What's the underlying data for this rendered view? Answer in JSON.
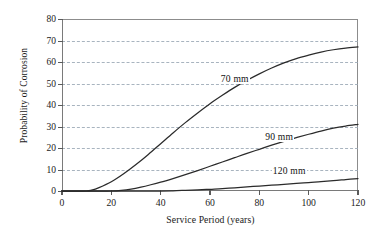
{
  "chart_data": {
    "type": "line",
    "title": "",
    "xlabel": "Service Period (years)",
    "ylabel": "Probability of Corrosion",
    "xlim": [
      0,
      120
    ],
    "ylim": [
      0,
      80
    ],
    "xticks": [
      0,
      20,
      40,
      60,
      80,
      100,
      120
    ],
    "yticks": [
      0,
      10,
      20,
      30,
      40,
      50,
      60,
      70,
      80
    ],
    "xtick_labels": [
      "0",
      "20",
      "40",
      "60",
      "80",
      "100",
      "120"
    ],
    "ytick_labels": [
      "0",
      "10",
      "20",
      "30",
      "40",
      "50",
      "60",
      "70",
      "80"
    ],
    "grid": "horizontal-dashed",
    "legend": "inline-labels",
    "series": [
      {
        "name": "70 mm",
        "label": "70 mm",
        "label_x": 64,
        "label_y": 52,
        "color": "#2b2b2b",
        "x": [
          0,
          5,
          10,
          12,
          15,
          20,
          25,
          30,
          35,
          40,
          45,
          50,
          55,
          60,
          65,
          70,
          75,
          80,
          85,
          90,
          95,
          100,
          105,
          110,
          115,
          120
        ],
        "y": [
          0,
          0,
          0,
          0.4,
          1.6,
          4.3,
          8.0,
          12.3,
          17.0,
          22.0,
          27.0,
          31.8,
          36.3,
          40.6,
          44.5,
          48.2,
          51.5,
          54.5,
          57.2,
          59.6,
          61.6,
          63.2,
          64.6,
          65.7,
          66.5,
          67.0
        ]
      },
      {
        "name": "90 mm",
        "label": "90 mm",
        "label_x": 82,
        "label_y": 25,
        "color": "#2b2b2b",
        "x": [
          0,
          5,
          10,
          15,
          20,
          24,
          28,
          32,
          36,
          40,
          45,
          50,
          55,
          60,
          65,
          70,
          75,
          80,
          85,
          90,
          95,
          100,
          105,
          110,
          115,
          120
        ],
        "y": [
          0,
          0,
          0,
          0,
          0,
          0.3,
          0.9,
          1.8,
          2.9,
          4.1,
          5.8,
          7.6,
          9.5,
          11.5,
          13.5,
          15.5,
          17.5,
          19.4,
          21.3,
          23.1,
          24.8,
          26.4,
          27.9,
          29.2,
          30.2,
          31.0
        ]
      },
      {
        "name": "120 mm",
        "label": "120 mm",
        "label_x": 85,
        "label_y": 9.5,
        "color": "#2b2b2b",
        "x": [
          0,
          10,
          20,
          30,
          40,
          45,
          50,
          55,
          60,
          65,
          70,
          75,
          80,
          85,
          90,
          95,
          100,
          105,
          110,
          115,
          120
        ],
        "y": [
          0,
          0,
          0,
          0,
          0,
          0.1,
          0.3,
          0.5,
          0.8,
          1.1,
          1.5,
          1.9,
          2.3,
          2.7,
          3.1,
          3.5,
          3.9,
          4.4,
          4.8,
          5.3,
          5.8
        ]
      }
    ]
  }
}
